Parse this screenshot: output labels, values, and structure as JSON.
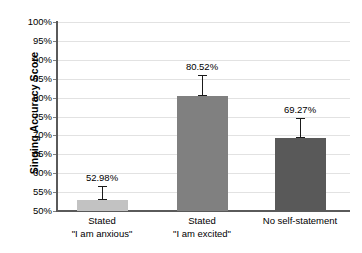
{
  "chart_data": {
    "type": "bar",
    "title": "",
    "xlabel": "",
    "ylabel": "Singing Accuracy Score",
    "ylim": [
      50,
      100
    ],
    "yticks": [
      "50%",
      "55%",
      "60%",
      "65%",
      "70%",
      "75%",
      "80%",
      "85%",
      "90%",
      "95%",
      "100%"
    ],
    "ytick_values": [
      50,
      55,
      60,
      65,
      70,
      75,
      80,
      85,
      90,
      95,
      100
    ],
    "grid": true,
    "legend": "none",
    "categories": [
      {
        "line1": "Stated",
        "line2": "\"I am anxious\""
      },
      {
        "line1": "Stated",
        "line2": "\"I am excited\""
      },
      {
        "line1": "No self-statement",
        "line2": ""
      }
    ],
    "values": [
      52.98,
      80.52,
      69.27
    ],
    "data_labels": [
      "52.98%",
      "80.52%",
      "69.27%"
    ],
    "error_bars": [
      {
        "low": 52.98,
        "high": 56.6
      },
      {
        "low": 80.52,
        "high": 86.1
      },
      {
        "low": 69.27,
        "high": 74.6
      }
    ],
    "bar_colors": [
      "#c2c2c2",
      "#808080",
      "#595959"
    ],
    "gridline_color": "#e2e2e2",
    "axis_color": "#5a5a5a",
    "error_bar_color": "#1a1a1a",
    "text_color": "#000000"
  }
}
